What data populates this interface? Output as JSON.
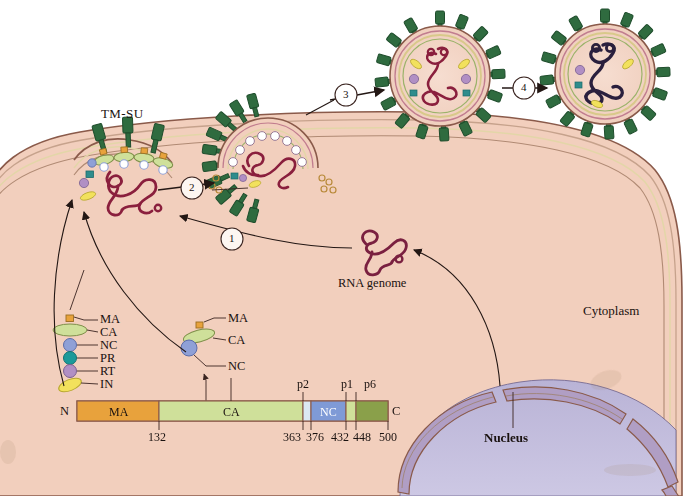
{
  "figure": {
    "background_color": "#ffffff",
    "cytoplasm_color": "#f2cfbd",
    "nucleus_color": "#c3bedd",
    "membrane_color": "#8a5a4a"
  },
  "labels": {
    "tm_su": "TM-SU",
    "cytoplasm": "Cytoplasm",
    "nucleus": "Nucleus",
    "rna_genome": "RNA genome"
  },
  "steps": [
    {
      "id": "1",
      "label": "1"
    },
    {
      "id": "2",
      "label": "2"
    },
    {
      "id": "3",
      "label": "3"
    },
    {
      "id": "4",
      "label": "4"
    }
  ],
  "protein_key": {
    "items": [
      {
        "label": "MA",
        "shape": "small-square",
        "color": "#e8a23c"
      },
      {
        "label": "CA",
        "shape": "ellipse",
        "color": "#cfe09a"
      },
      {
        "label": "NC",
        "shape": "circle",
        "color": "#8fa0d6"
      },
      {
        "label": "PR",
        "shape": "circle",
        "color": "#1c9a9a"
      },
      {
        "label": "RT",
        "shape": "circle",
        "color": "#b18fc4"
      },
      {
        "label": "IN",
        "shape": "ellipse-tilted",
        "color": "#f2e15c"
      }
    ]
  },
  "gag_subcomplex": {
    "items": [
      {
        "label": "MA",
        "color": "#e8a23c"
      },
      {
        "label": "CA",
        "color": "#cfe09a"
      },
      {
        "label": "NC",
        "color": "#8fa0d6"
      }
    ]
  },
  "domain_bar": {
    "n_terminus": "N",
    "c_terminus": "C",
    "domains": [
      {
        "label": "MA",
        "color": "#e8a23c",
        "start": 1,
        "end": 132,
        "label_position": "inside"
      },
      {
        "label": "CA",
        "color": "#cfe09a",
        "start": 132,
        "end": 363,
        "label_position": "inside"
      },
      {
        "label": "p2",
        "color": "#dbe8f4",
        "start": 363,
        "end": 376,
        "label_position": "above"
      },
      {
        "label": "NC",
        "color": "#7f9ad6",
        "start": 376,
        "end": 432,
        "label_position": "inside"
      },
      {
        "label": "p1",
        "color": "#cfe09a",
        "start": 432,
        "end": 448,
        "label_position": "above"
      },
      {
        "label": "p6",
        "color": "#8aa04a",
        "start": 448,
        "end": 500,
        "label_position": "above"
      }
    ],
    "tick_labels": [
      "132",
      "363",
      "376",
      "432",
      "448",
      "500"
    ]
  },
  "virions": {
    "immature": {
      "name": "immature-virion",
      "spike_color": "#2f6b3f",
      "envelope_color": "#d8c98a",
      "core_color": "#8a1f3d"
    },
    "mature": {
      "name": "mature-virion",
      "spike_color": "#2f6b3f",
      "envelope_color": "#d8c98a",
      "core_color": "#2a1f3d"
    }
  }
}
